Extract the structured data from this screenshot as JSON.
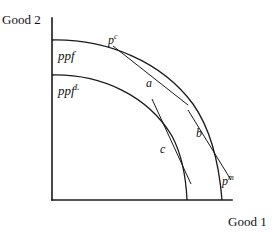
{
  "figure": {
    "axes": {
      "y_label": "Good 2",
      "x_label": "Good 1",
      "origin": {
        "x": 52,
        "y": 200
      },
      "y_top": {
        "x": 52,
        "y": 18
      },
      "x_right": {
        "x": 232,
        "y": 200
      },
      "color": "#1a1a1a"
    },
    "curves": [
      {
        "name": "ppf",
        "label": "ppf",
        "label_sup": "",
        "y_intercept": 40,
        "x_intercept": 222,
        "color": "#1a1a1a"
      },
      {
        "name": "ppf-limited",
        "label": "ppf",
        "label_sup": "L",
        "y_intercept": 75,
        "x_intercept": 187,
        "color": "#1a1a1a"
      }
    ],
    "points": [
      {
        "id": "a",
        "label": "a",
        "x": 152,
        "y": 88,
        "on_curve": "ppf"
      },
      {
        "id": "b",
        "label": "b",
        "x": 202,
        "y": 136,
        "on_curve": "ppf"
      },
      {
        "id": "c",
        "label": "c",
        "x": 170,
        "y": 153,
        "on_curve": "ppf-limited"
      }
    ],
    "price_lines": [
      {
        "id": "pc",
        "label": "p",
        "label_sup": "c",
        "tangent_at": "a",
        "x1": 113,
        "y1": 46,
        "x2": 188,
        "y2": 105
      },
      {
        "id": "pm",
        "label": "p",
        "label_sup": "m",
        "tangent_at": "b",
        "x1": 188,
        "y1": 110,
        "x2": 231,
        "y2": 180
      },
      {
        "id": "pc-inner",
        "label": "",
        "label_sup": "",
        "tangent_at": "c",
        "x1": 152,
        "y1": 99,
        "x2": 191,
        "y2": 184
      }
    ]
  }
}
